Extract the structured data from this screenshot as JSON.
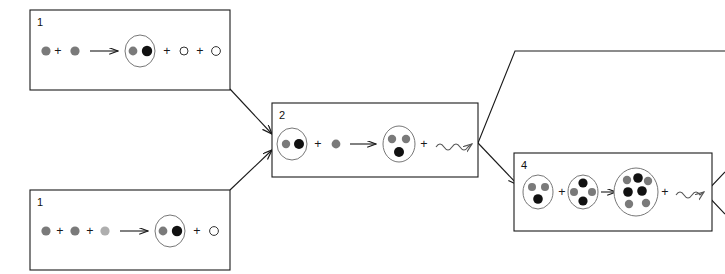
{
  "diagram": {
    "background": "#ffffff",
    "width": 725,
    "height": 274,
    "particle_colors": {
      "proton": "#7a7a7a",
      "neutron": "#111111",
      "positron": "#aeaeae",
      "neutrino_outline": "#333333",
      "nucleus_ring": "#777777",
      "box_stroke": "#1a1a1a",
      "gamma": "#555555"
    },
    "operator_plus": "+",
    "boxes": [
      {
        "id": "box-step-1-top",
        "label": "1",
        "x": 30,
        "y": 10,
        "width": 200,
        "height": 80,
        "equation": {
          "reactants": [
            {
              "kind": "particle",
              "type": "proton"
            },
            {
              "kind": "particle",
              "type": "proton"
            }
          ],
          "arrow": "straight",
          "products": [
            {
              "kind": "nucleus",
              "parts": [
                "proton",
                "neutron"
              ]
            },
            {
              "kind": "particle",
              "type": "neutrino"
            },
            {
              "kind": "particle",
              "type": "neutrino"
            }
          ]
        }
      },
      {
        "id": "box-step-1-bottom",
        "label": "1",
        "x": 30,
        "y": 190,
        "width": 200,
        "height": 80,
        "equation": {
          "reactants": [
            {
              "kind": "particle",
              "type": "proton"
            },
            {
              "kind": "particle",
              "type": "proton"
            },
            {
              "kind": "particle",
              "type": "positron"
            }
          ],
          "arrow": "straight",
          "products": [
            {
              "kind": "nucleus",
              "parts": [
                "proton",
                "neutron"
              ]
            },
            {
              "kind": "particle",
              "type": "neutrino"
            }
          ]
        }
      },
      {
        "id": "box-step-2",
        "label": "2",
        "x": 272,
        "y": 103,
        "width": 206,
        "height": 74,
        "equation": {
          "reactants": [
            {
              "kind": "nucleus",
              "parts": [
                "proton",
                "neutron"
              ]
            },
            {
              "kind": "particle",
              "type": "proton"
            }
          ],
          "arrow": "straight",
          "products": [
            {
              "kind": "nucleus",
              "parts": [
                "proton",
                "proton",
                "neutron"
              ]
            },
            {
              "kind": "gamma"
            }
          ]
        }
      },
      {
        "id": "box-step-4",
        "label": "4",
        "x": 514,
        "y": 153,
        "width": 198,
        "height": 78,
        "equation": {
          "reactants": [
            {
              "kind": "nucleus",
              "parts": [
                "proton",
                "proton",
                "neutron"
              ]
            },
            {
              "kind": "nucleus",
              "parts": [
                "neutron",
                "proton",
                "proton",
                "neutron"
              ]
            }
          ],
          "arrow": "straight",
          "products": [
            {
              "kind": "nucleus",
              "parts": [
                "proton",
                "neutron",
                "proton",
                "neutron",
                "neutron",
                "neutron",
                "proton",
                "proton"
              ]
            },
            {
              "kind": "gamma"
            }
          ]
        }
      }
    ],
    "connectors": [
      {
        "id": "conn-top1-to-2",
        "from": "box-step-1-top",
        "to": "box-step-2",
        "arrowhead": true
      },
      {
        "id": "conn-bottom1-to-2",
        "from": "box-step-1-bottom",
        "to": "box-step-2",
        "arrowhead": true
      },
      {
        "id": "conn-2-to-upper-right",
        "from": "box-step-2",
        "to": "offscreen-right",
        "arrowhead": false
      },
      {
        "id": "conn-2-to-4",
        "from": "box-step-2",
        "to": "box-step-4",
        "arrowhead": true
      },
      {
        "id": "conn-4-to-offscreen",
        "from": "box-step-4",
        "to": "offscreen-right",
        "arrowhead": false
      }
    ]
  }
}
